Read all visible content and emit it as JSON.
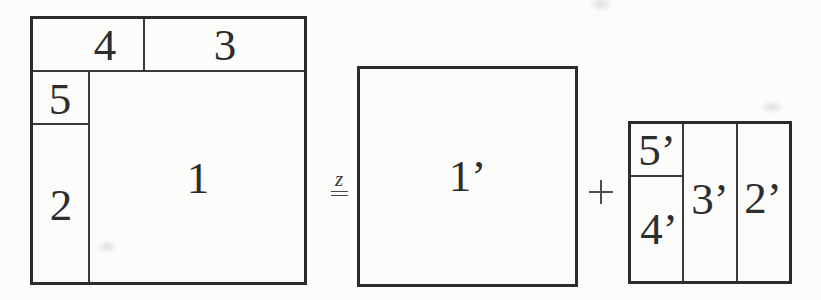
{
  "figure": {
    "left_square": {
      "regions": [
        {
          "label": "4"
        },
        {
          "label": "3"
        },
        {
          "label": "5"
        },
        {
          "label": "2"
        },
        {
          "label": "1"
        }
      ]
    },
    "relation": {
      "superscript": "z",
      "symbol": "="
    },
    "operator": {
      "plus": "+"
    },
    "middle_square": {
      "label": "1’"
    },
    "right_square": {
      "regions": [
        {
          "label": "5’"
        },
        {
          "label": "4’"
        },
        {
          "label": "3’"
        },
        {
          "label": "2’"
        }
      ]
    },
    "colors": {
      "background": "#fcfcfa",
      "outer_border": "#2c2c2c",
      "inner_line": "#3a3a3a",
      "text": "#2d2d2d"
    }
  }
}
